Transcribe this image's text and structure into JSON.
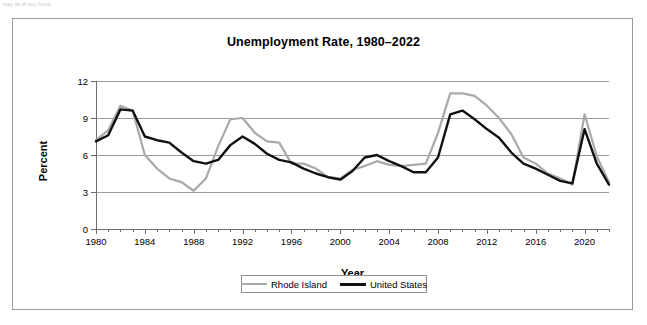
{
  "top_fragment": "may as of any fiscal",
  "chart_data": {
    "type": "line",
    "title": "Unemployment Rate, 1980–2022",
    "xlabel": "Year",
    "ylabel": "Percent",
    "xlim": [
      1980,
      2022
    ],
    "ylim": [
      0,
      12
    ],
    "ytick_labels": [
      "0",
      "3",
      "6",
      "9",
      "12"
    ],
    "yticks": [
      0,
      3,
      6,
      9,
      12
    ],
    "xtick_labels": [
      "1980",
      "1984",
      "1988",
      "1992",
      "1996",
      "2000",
      "2004",
      "2008",
      "2012",
      "2016",
      "2020"
    ],
    "xticks": [
      1980,
      1984,
      1988,
      1992,
      1996,
      2000,
      2004,
      2008,
      2012,
      2016,
      2020
    ],
    "minor_xtick_interval": 1,
    "grid": "horizontal",
    "legend_position": "bottom-center",
    "x": [
      1980,
      1981,
      1982,
      1983,
      1984,
      1985,
      1986,
      1987,
      1988,
      1989,
      1990,
      1991,
      1992,
      1993,
      1994,
      1995,
      1996,
      1997,
      1998,
      1999,
      2000,
      2001,
      2002,
      2003,
      2004,
      2005,
      2006,
      2007,
      2008,
      2009,
      2010,
      2011,
      2012,
      2013,
      2014,
      2015,
      2016,
      2017,
      2018,
      2019,
      2020,
      2021,
      2022
    ],
    "series": [
      {
        "name": "Rhode Island",
        "color": "#a9a9a9",
        "values": [
          7.2,
          8.0,
          10.0,
          9.6,
          6.0,
          4.9,
          4.1,
          3.8,
          3.1,
          4.1,
          6.7,
          8.9,
          9.0,
          7.8,
          7.1,
          7.0,
          5.3,
          5.3,
          4.9,
          4.2,
          4.1,
          4.8,
          5.1,
          5.5,
          5.2,
          5.1,
          5.2,
          5.3,
          7.8,
          11.0,
          11.0,
          10.8,
          10.0,
          9.0,
          7.7,
          5.8,
          5.3,
          4.5,
          4.1,
          3.6,
          9.3,
          5.9,
          3.8
        ]
      },
      {
        "name": "United States",
        "color": "#111111",
        "values": [
          7.1,
          7.6,
          9.7,
          9.6,
          7.5,
          7.2,
          7.0,
          6.2,
          5.5,
          5.3,
          5.6,
          6.8,
          7.5,
          6.9,
          6.1,
          5.6,
          5.4,
          4.9,
          4.5,
          4.2,
          4.0,
          4.7,
          5.8,
          6.0,
          5.5,
          5.1,
          4.6,
          4.6,
          5.8,
          9.3,
          9.6,
          8.9,
          8.1,
          7.4,
          6.2,
          5.3,
          4.9,
          4.4,
          3.9,
          3.7,
          8.1,
          5.3,
          3.6
        ]
      }
    ]
  }
}
